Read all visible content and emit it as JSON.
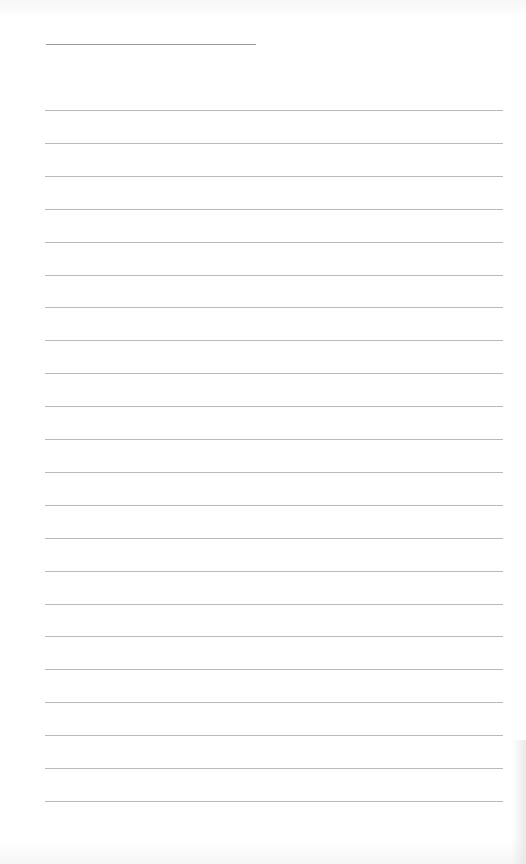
{
  "document": {
    "type": "lined-paper",
    "header_line": {
      "visible": true
    },
    "rules": {
      "count": 22,
      "first_top": 110,
      "spacing": 32.9
    },
    "colors": {
      "paper": "#ffffff",
      "rule": "#b9b9b9",
      "header_rule": "#9a9a9a"
    }
  }
}
